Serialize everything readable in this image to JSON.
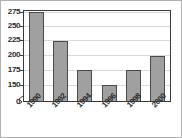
{
  "chart_data": {
    "type": "bar",
    "title": "",
    "subtitle": "",
    "xlabel": "",
    "ylabel": "",
    "categories": [
      "1990",
      "1992",
      "1994",
      "1996",
      "1998",
      "2000"
    ],
    "values": [
      275,
      225,
      175,
      150,
      175,
      200
    ],
    "series": [
      {
        "name": "",
        "values": [
          275,
          225,
          175,
          150,
          175,
          200
        ]
      }
    ],
    "ylim": [
      150,
      275
    ],
    "y_axis_origin_label": "0",
    "y_axis_broken": true,
    "y_ticks": [
      150,
      175,
      200,
      225,
      250,
      275
    ],
    "y_tick_labels": [
      "150",
      "175",
      "200",
      "225",
      "250",
      "275"
    ],
    "grid": true,
    "grid_axis": "y",
    "legend": false,
    "legend_position": "none",
    "annotations": [],
    "x_label_rotation_deg": -45,
    "colors": {
      "bar_fill": "#a0a0a0",
      "bar_border": "#4a4a4a",
      "gridline": "#d9d9d9",
      "axis": "#3a3a3a",
      "text": "#2b2b2b",
      "plot_background": "#ffffff",
      "page_background": "#ffffff",
      "outer_frame": "#b0b0b0"
    }
  }
}
